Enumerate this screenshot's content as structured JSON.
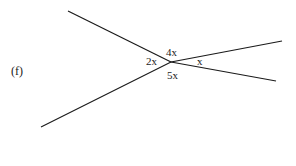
{
  "figure_label": "(f)",
  "angles": {
    "left": "2x",
    "top": "4x",
    "right": "x",
    "bottom": "5x"
  },
  "diagram": {
    "type": "angles at a point",
    "center": [
      171,
      62
    ],
    "rays": [
      {
        "name": "upper-left",
        "end": [
          68,
          11
        ]
      },
      {
        "name": "lower-left",
        "end": [
          41,
          127
        ]
      },
      {
        "name": "upper-right",
        "end": [
          282,
          41
        ]
      },
      {
        "name": "lower-right",
        "end": [
          276,
          81
        ]
      }
    ],
    "line_color": "#1a1a1a"
  }
}
